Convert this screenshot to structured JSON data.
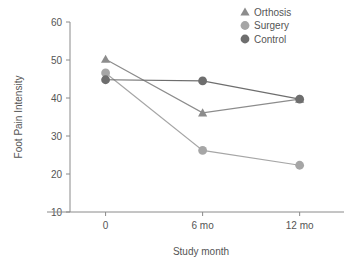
{
  "chart_data": {
    "type": "line",
    "title": "",
    "xlabel": "Study month",
    "ylabel": "Foot Pain Intensity",
    "categories": [
      "0",
      "6 mo",
      "12 mo"
    ],
    "x": [
      0,
      6,
      12
    ],
    "xtick_labels": [
      "0",
      "6 mo",
      "12 mo"
    ],
    "ytick_labels": [
      "10",
      "20",
      "30",
      "40",
      "50",
      "60"
    ],
    "yticks": [
      10,
      20,
      30,
      40,
      50,
      60
    ],
    "ylim": [
      10,
      60
    ],
    "xlim": [
      -2.2,
      14.0
    ],
    "grid": false,
    "legend_position": "top-right",
    "series": [
      {
        "name": "Orthosis",
        "marker": "triangle",
        "color": "#8c8c8c",
        "values": [
          50.2,
          36.1,
          39.7
        ]
      },
      {
        "name": "Surgery",
        "marker": "circle",
        "color": "#a6a6a6",
        "values": [
          46.6,
          26.2,
          22.3
        ]
      },
      {
        "name": "Control",
        "marker": "circle",
        "color": "#6e6e6e",
        "values": [
          44.8,
          44.5,
          39.7
        ]
      }
    ]
  },
  "legend": {
    "items": [
      {
        "label": "Orthosis"
      },
      {
        "label": "Surgery"
      },
      {
        "label": "Control"
      }
    ]
  },
  "axes": {
    "y_title": "Foot Pain Intensity",
    "x_title": "Study month"
  }
}
